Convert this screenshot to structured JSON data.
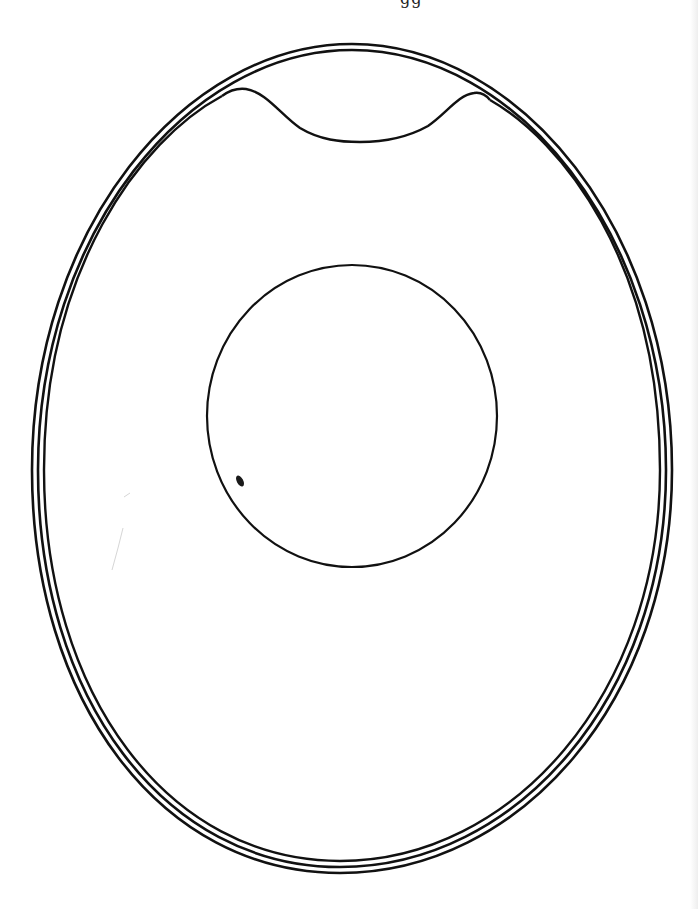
{
  "figure": {
    "type": "egg-cross-section-schematic",
    "top_text_fragment": "gg",
    "labels": [],
    "parts": [
      {
        "name": "shell",
        "lines": 3,
        "description": "outer shell drawn as three concentric lines"
      },
      {
        "name": "air-cell",
        "description": "space at the blunt top end between the shell and the inner membrane, which dips in a shallow curve with two bumps"
      },
      {
        "name": "yolk",
        "description": "large circle in the upper-middle of the egg"
      },
      {
        "name": "germinal-disc",
        "description": "small dark oval spot on the lower-left of the yolk"
      }
    ],
    "geometry": {
      "egg_bbox": {
        "left": 32,
        "top": 44,
        "right": 672,
        "bottom": 873
      },
      "yolk_center": [
        352,
        416
      ],
      "yolk_radius": 146,
      "germ_spot_center": [
        240,
        481
      ]
    },
    "colors": {
      "line": "#111111",
      "background": "#ffffff"
    }
  }
}
